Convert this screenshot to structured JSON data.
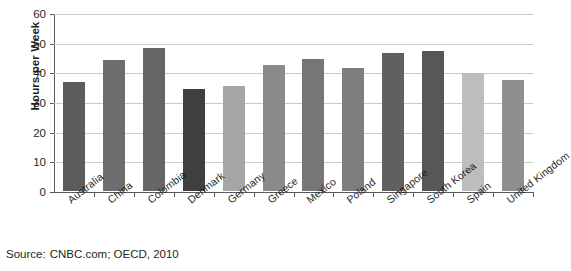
{
  "chart_data": {
    "type": "bar",
    "title": "",
    "xlabel": "",
    "ylabel": "Hours per Week",
    "ylim": [
      0,
      60
    ],
    "ytick_step": 10,
    "yticks": [
      0,
      10,
      20,
      30,
      40,
      50,
      60
    ],
    "grid": "horizontal",
    "legend": "none",
    "categories": [
      "Australia",
      "China",
      "Colombia",
      "Denmark",
      "Germany",
      "Greece",
      "Mexico",
      "Poland",
      "Singapore",
      "South Korea",
      "Spain",
      "United Kingdom"
    ],
    "values": [
      36.6,
      44.2,
      48.2,
      34.4,
      35.3,
      42.5,
      44.4,
      41.6,
      46.6,
      47.3,
      39.7,
      37.3
    ],
    "bar_colors": [
      "#5c5c5c",
      "#6e6e6e",
      "#666666",
      "#3f3f3f",
      "#a6a6a6",
      "#8a8a8a",
      "#767676",
      "#7d7d7d",
      "#606060",
      "#575757",
      "#bdbdbd",
      "#8f8f8f"
    ]
  },
  "axis": {
    "y_title": "Hours per Week",
    "ytick_labels": [
      "60",
      "50",
      "40",
      "30",
      "20",
      "10",
      "0"
    ]
  },
  "source": {
    "label": "Source:",
    "text": "CNBC.com; OECD, 2010"
  },
  "colors": {
    "axis": "#58595b",
    "gridline": "#c9cacb",
    "text": "#231f20",
    "background": "#ffffff"
  }
}
